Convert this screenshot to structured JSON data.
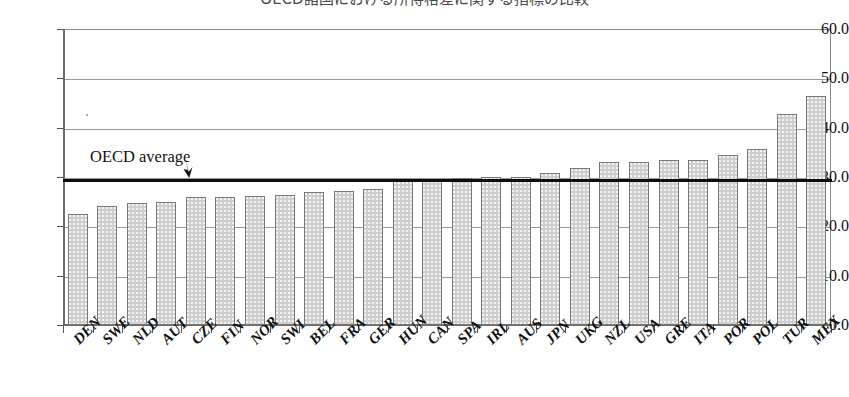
{
  "title": "OECD諸国における所得格差に関する指標の比較",
  "annotations": {
    "average_label": "OECD average",
    "arrow_icon": "down-arrow-icon"
  },
  "axis": {
    "y_ticks": [
      "60.0",
      "50.0",
      "40.0",
      "30.0",
      "20.0",
      "10.0",
      "0.0"
    ],
    "y_min": 0,
    "y_max": 60,
    "y_step": 10
  },
  "chart_data": {
    "type": "bar",
    "title": "OECD諸国における所得格差に関する指標の比較",
    "xlabel": "",
    "ylabel": "",
    "ylim": [
      0,
      60
    ],
    "ytick_labels": [
      "0.0",
      "10.0",
      "20.0",
      "30.0",
      "40.0",
      "50.0",
      "60.0"
    ],
    "ytick_values": [
      0,
      10,
      20,
      30,
      40,
      50,
      60
    ],
    "grid": true,
    "legend": "none",
    "categories": [
      "DEN",
      "SWE",
      "NLD",
      "AUT",
      "CZE",
      "FIN",
      "NOR",
      "SWI",
      "BEL",
      "FRA",
      "GER",
      "HUN",
      "CAN",
      "SPA",
      "IRL",
      "AUS",
      "JPN",
      "UKG",
      "NZL",
      "USA",
      "GRE",
      "ITA",
      "POR",
      "POL",
      "TUR",
      "MEX"
    ],
    "values": [
      22.5,
      24.1,
      24.8,
      24.9,
      25.9,
      26.0,
      26.1,
      26.4,
      27.0,
      27.1,
      27.5,
      29.1,
      29.4,
      29.9,
      30.0,
      30.0,
      30.8,
      31.8,
      33.0,
      33.1,
      33.4,
      33.5,
      34.5,
      35.6,
      42.8,
      46.5
    ],
    "reference_line": {
      "label": "OECD average",
      "value": 29.3
    }
  }
}
